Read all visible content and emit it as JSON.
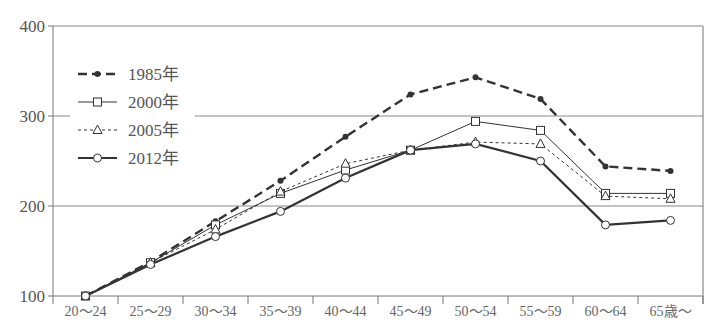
{
  "chart_data": {
    "type": "line",
    "title": "",
    "xlabel": "",
    "ylabel": "",
    "ylim": [
      100,
      400
    ],
    "yticks": [
      100,
      200,
      300,
      400
    ],
    "grid": "horizontal at 200, 300, 400",
    "legend_position": "upper-left inside plot",
    "categories": [
      "20～24",
      "25～29",
      "30～34",
      "35～39",
      "40～44",
      "45～49",
      "50～54",
      "55～59",
      "60～64",
      "65歳～"
    ],
    "series": [
      {
        "name": "1985年",
        "style": "dashed-bold",
        "marker": "filled-dot",
        "values": [
          100,
          138,
          183,
          228,
          277,
          324,
          343,
          319,
          244,
          239
        ]
      },
      {
        "name": "2000年",
        "style": "thin-solid",
        "marker": "square",
        "values": [
          100,
          137,
          179,
          214,
          240,
          262,
          294,
          284,
          214,
          214
        ]
      },
      {
        "name": "2005年",
        "style": "thin-dashed",
        "marker": "triangle",
        "values": [
          100,
          137,
          174,
          216,
          247,
          262,
          271,
          269,
          211,
          208
        ]
      },
      {
        "name": "2012年",
        "style": "bold-solid",
        "marker": "circle",
        "values": [
          100,
          135,
          166,
          194,
          231,
          262,
          269,
          250,
          179,
          184
        ]
      }
    ]
  },
  "colors": {
    "line": "#333333",
    "axis": "#777777",
    "text": "#555555",
    "grid": "#888888"
  }
}
